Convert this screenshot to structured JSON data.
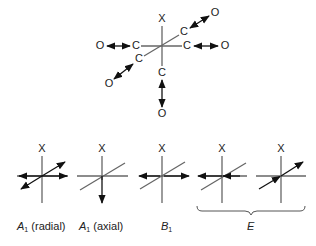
{
  "molecule": {
    "axis_label": "X",
    "center_atom_labels": [
      "C",
      "C",
      "C",
      "C",
      "C"
    ],
    "ligand_atom_labels": [
      "O",
      "O",
      "O",
      "O",
      "O"
    ]
  },
  "modes": [
    {
      "label_main": "A",
      "label_sub": "1",
      "label_suffix": " (radial)",
      "axis_label": "X"
    },
    {
      "label_main": "A",
      "label_sub": "1",
      "label_suffix": " (axial)",
      "axis_label": "X"
    },
    {
      "label_main": "B",
      "label_sub": "1",
      "label_suffix": "",
      "axis_label": "X"
    },
    {
      "axis_label": "X"
    },
    {
      "axis_label": "X"
    }
  ],
  "brace_label": "E",
  "colors": {
    "axis": "#666666",
    "arrow": "#111111",
    "text": "#222222"
  }
}
